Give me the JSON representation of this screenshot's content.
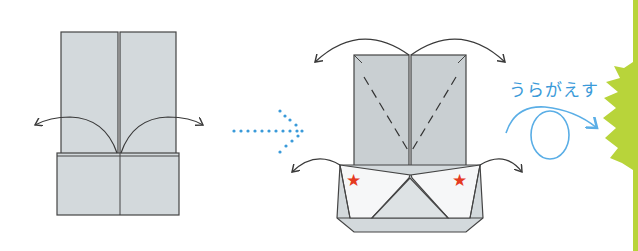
{
  "diagram": {
    "steps": [
      {
        "name": "step-1",
        "description": "Two vertical flaps on top of a folded base; fold flaps outward along curved arrows"
      },
      {
        "name": "step-2",
        "description": "Top flap with dashed valley-fold lines; fold corners outward; star-marked corners"
      }
    ],
    "next_arrow": "dotted-arrow-right",
    "instruction_label": "うらがえす",
    "instruction_icon": "flip-over-loop-arrow",
    "markers": [
      "★",
      "★"
    ],
    "colors": {
      "paper": "#d3d9dc",
      "paper_dark": "#c4cbcf",
      "line": "#3a3a3a",
      "accent_blue": "#3a9ad9",
      "star_red": "#e53a1f",
      "green_edge": "#b8d43a"
    }
  }
}
